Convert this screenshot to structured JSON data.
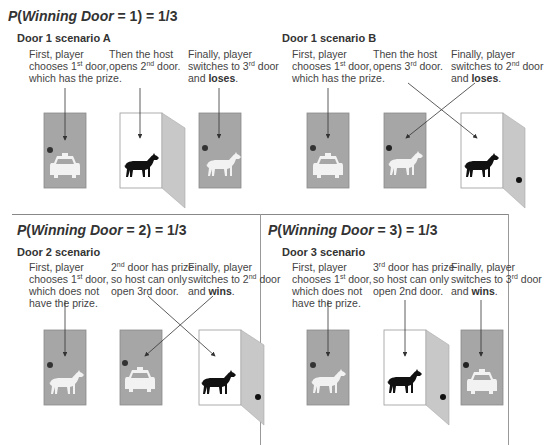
{
  "panels": [
    {
      "title_prefix": "P",
      "title_var": "Winning Door",
      "title_suffix": " = 1) = 1/3",
      "scenarios": [
        {
          "subtitle": "Door 1 scenario A",
          "steps": [
            {
              "pre": "First, player chooses 1",
              "sup": "st",
              "post": " door, which has the prize.",
              "bold": ""
            },
            {
              "pre": "Then the host opens 2",
              "sup": "nd",
              "post": " door.",
              "bold": ""
            },
            {
              "pre": "Finally, player switches to 3",
              "sup": "rd",
              "post": " door and ",
              "bold": "loses",
              "end": "."
            }
          ],
          "doors": [
            {
              "state": "closed",
              "content": "car"
            },
            {
              "state": "open",
              "content": "goat"
            },
            {
              "state": "closed",
              "content": "goat"
            }
          ]
        },
        {
          "subtitle": "Door 1 scenario B",
          "steps": [
            {
              "pre": "First, player chooses 1",
              "sup": "st",
              "post": " door, which has the prize.",
              "bold": ""
            },
            {
              "pre": "Then the host opens 3",
              "sup": "rd",
              "post": " door.",
              "bold": ""
            },
            {
              "pre": "Finally, player switches to 2",
              "sup": "nd",
              "post": " door and ",
              "bold": "loses",
              "end": "."
            }
          ],
          "doors": [
            {
              "state": "closed",
              "content": "car"
            },
            {
              "state": "closed",
              "content": "goat"
            },
            {
              "state": "open",
              "content": "goat"
            }
          ]
        }
      ]
    },
    {
      "title_prefix": "P",
      "title_var": "Winning Door",
      "title_suffix": " = 2) = 1/3",
      "scenarios": [
        {
          "subtitle": "Door 2 scenario",
          "steps": [
            {
              "pre": "First, player chooses 1",
              "sup": "st",
              "post": " door, which does not have the prize.",
              "bold": ""
            },
            {
              "pre": "2",
              "sup": "nd",
              "post": " door has prize so host can only open 3rd door.",
              "bold": ""
            },
            {
              "pre": "Finally, player switches to 2",
              "sup": "nd",
              "post": " door and ",
              "bold": "wins",
              "end": "."
            }
          ],
          "doors": [
            {
              "state": "closed",
              "content": "goat"
            },
            {
              "state": "closed",
              "content": "car"
            },
            {
              "state": "open",
              "content": "goat"
            }
          ]
        }
      ]
    },
    {
      "title_prefix": "P",
      "title_var": "Winning Door",
      "title_suffix": " = 3) = 1/3",
      "scenarios": [
        {
          "subtitle": "Door 3 scenario",
          "steps": [
            {
              "pre": "First, player chooses 1",
              "sup": "st",
              "post": " door, which does not have the prize.",
              "bold": ""
            },
            {
              "pre": "3",
              "sup": "rd",
              "post": " door has prize so host can only open 2nd door.",
              "bold": ""
            },
            {
              "pre": "Finally, player switches to 3",
              "sup": "rd",
              "post": " door and ",
              "bold": "wins",
              "end": "."
            }
          ],
          "doors": [
            {
              "state": "closed",
              "content": "goat"
            },
            {
              "state": "open",
              "content": "goat"
            },
            {
              "state": "closed",
              "content": "car"
            }
          ]
        }
      ]
    }
  ],
  "colors": {
    "door_closed": "#a6a6a6",
    "door_open_panel": "#c8c8c8",
    "knob": "#222222",
    "goat_dark": "#111111",
    "goat_light": "#f2f2f2",
    "car": "#f2f2f2",
    "arrow": "#333333",
    "divider": "#888888"
  }
}
